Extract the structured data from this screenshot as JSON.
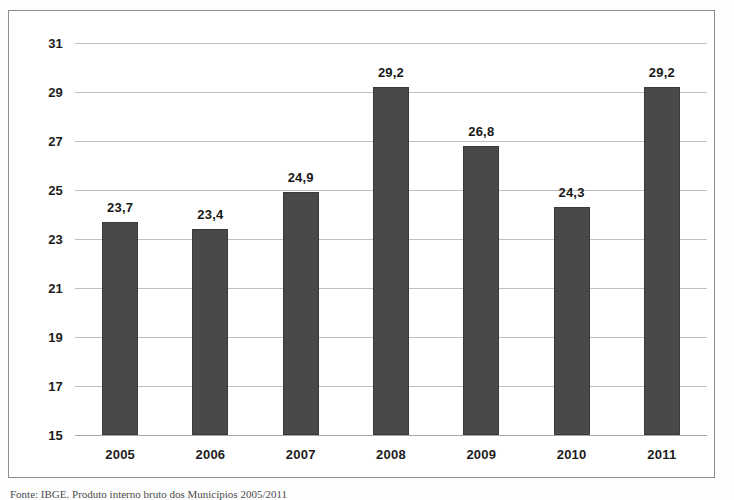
{
  "figure": {
    "frame_border_color": "#8d8d8d",
    "background": "#ffffff",
    "source_caption": "Fonte: IBGE. Produto interno bruto dos Municípios 2005/2011"
  },
  "chart_data": {
    "type": "bar",
    "title": "",
    "subtitle": "",
    "xlabel": "",
    "ylabel": "",
    "categories": [
      "2005",
      "2006",
      "2007",
      "2008",
      "2009",
      "2010",
      "2011"
    ],
    "values": [
      23.7,
      23.4,
      24.9,
      29.2,
      26.8,
      24.3,
      29.2
    ],
    "value_labels": [
      "23,7",
      "23,4",
      "24,9",
      "29,2",
      "26,8",
      "24,3",
      "29,2"
    ],
    "ylim": [
      15,
      31
    ],
    "yticks": [
      31,
      29,
      27,
      25,
      23,
      21,
      19,
      17,
      15
    ],
    "ytick_labels": [
      "31",
      "29",
      "27",
      "25",
      "23",
      "21",
      "19",
      "17",
      "15"
    ],
    "grid": true,
    "grid_axis": "y",
    "grid_color": "#bfbfbf",
    "legend": false,
    "legend_position": "none",
    "series": [
      {
        "name": "",
        "color": "#494949",
        "values": [
          23.7,
          23.4,
          24.9,
          29.2,
          26.8,
          24.3,
          29.2
        ]
      }
    ],
    "decimal_separator": ","
  }
}
